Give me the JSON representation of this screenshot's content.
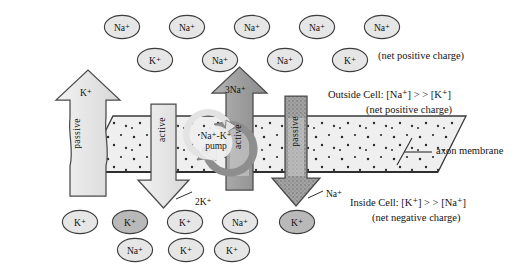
{
  "figure": {
    "membrane_label": "axon membrane"
  },
  "annotations": {
    "outside_net_charge_top": "(net positive charge)",
    "outside_cell_conc": "Outside Cell: [Na⁺] > > [K⁺]",
    "outside_net_charge": "(net positive charge)",
    "inside_cell_conc": "Inside Cell: [K⁺] > > [Na⁺]",
    "inside_net_charge": "(net negative charge)"
  },
  "channels": [
    {
      "id": "passive-k-out",
      "transport_label": "passive",
      "ion_label": "K⁺",
      "direction": "up",
      "shade": "light"
    },
    {
      "id": "active-k-in",
      "transport_label": "active",
      "ion_label": "2K⁺",
      "direction": "down",
      "shade": "light"
    },
    {
      "id": "active-na-out",
      "transport_label": "active",
      "ion_label": "3Na⁺",
      "direction": "up",
      "shade": "dark"
    },
    {
      "id": "passive-na-in",
      "transport_label": "passive",
      "ion_label": "Na⁺",
      "direction": "down",
      "shade": "dark"
    }
  ],
  "pump": {
    "label_line1": "Na⁺-K⁺",
    "label_line2": "pump"
  },
  "ions_outside": [
    {
      "label": "Na⁺",
      "x": 122,
      "y": 27,
      "shade": "light"
    },
    {
      "label": "Na⁺",
      "x": 187,
      "y": 27,
      "shade": "light"
    },
    {
      "label": "Na⁺",
      "x": 252,
      "y": 27,
      "shade": "light"
    },
    {
      "label": "Na⁺",
      "x": 317,
      "y": 27,
      "shade": "light"
    },
    {
      "label": "Na⁺",
      "x": 382,
      "y": 27,
      "shade": "light"
    },
    {
      "label": "K⁺",
      "x": 155,
      "y": 60,
      "shade": "light"
    },
    {
      "label": "Na⁺",
      "x": 220,
      "y": 60,
      "shade": "light"
    },
    {
      "label": "Na⁺",
      "x": 285,
      "y": 60,
      "shade": "light"
    },
    {
      "label": "K⁺",
      "x": 350,
      "y": 60,
      "shade": "light"
    }
  ],
  "ions_inside": [
    {
      "label": "K⁺",
      "x": 80,
      "y": 222,
      "shade": "light"
    },
    {
      "label": "K⁺",
      "x": 130,
      "y": 222,
      "shade": "dark"
    },
    {
      "label": "K⁺",
      "x": 185,
      "y": 222,
      "shade": "light"
    },
    {
      "label": "Na⁺",
      "x": 240,
      "y": 222,
      "shade": "light"
    },
    {
      "label": "K⁺",
      "x": 297,
      "y": 222,
      "shade": "dark"
    },
    {
      "label": "Na⁺",
      "x": 135,
      "y": 250,
      "shade": "light"
    },
    {
      "label": "K⁺",
      "x": 186,
      "y": 250,
      "shade": "light"
    },
    {
      "label": "K⁺",
      "x": 232,
      "y": 250,
      "shade": "light"
    }
  ],
  "colors": {
    "outline": "#3a3a3a",
    "membrane_fill": "#efefef",
    "light_shade": "#e2e2e2",
    "dark_shade": "#9e9e9e",
    "ion_light": "#e6e6e6",
    "ion_dark": "#b9b9b9",
    "text": "#141414"
  }
}
